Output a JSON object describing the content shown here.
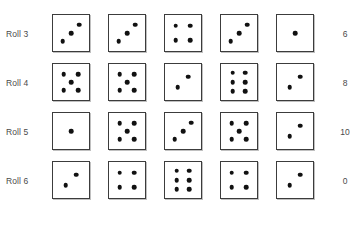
{
  "figure": {
    "caption": "",
    "colors": {
      "die_border": "#3c3c3c",
      "pip": "#111111",
      "text": "#4a4a4a",
      "background": "#ffffff"
    }
  },
  "table": {
    "dice_per_roll": 5,
    "rows": [
      {
        "label": "Roll 3",
        "dice": [
          3,
          3,
          4,
          3,
          1
        ],
        "value": "6"
      },
      {
        "label": "Roll 4",
        "dice": [
          5,
          5,
          2,
          6,
          2
        ],
        "value": "8"
      },
      {
        "label": "Roll 5",
        "dice": [
          1,
          5,
          3,
          5,
          2
        ],
        "value": "10"
      },
      {
        "label": "Roll 6",
        "dice": [
          2,
          4,
          6,
          4,
          2
        ],
        "value": "0"
      }
    ]
  },
  "pip_layouts": {
    "1": [
      [
        50,
        50
      ]
    ],
    "2": [
      [
        35,
        65
      ],
      [
        65,
        35
      ]
    ],
    "3": [
      [
        27,
        73
      ],
      [
        50,
        50
      ],
      [
        73,
        27
      ]
    ],
    "4": [
      [
        30,
        30
      ],
      [
        70,
        30
      ],
      [
        30,
        70
      ],
      [
        70,
        70
      ]
    ],
    "5": [
      [
        30,
        28
      ],
      [
        70,
        28
      ],
      [
        50,
        50
      ],
      [
        30,
        72
      ],
      [
        70,
        72
      ]
    ],
    "6": [
      [
        32,
        24
      ],
      [
        68,
        24
      ],
      [
        32,
        50
      ],
      [
        68,
        50
      ],
      [
        32,
        76
      ],
      [
        68,
        76
      ]
    ]
  }
}
